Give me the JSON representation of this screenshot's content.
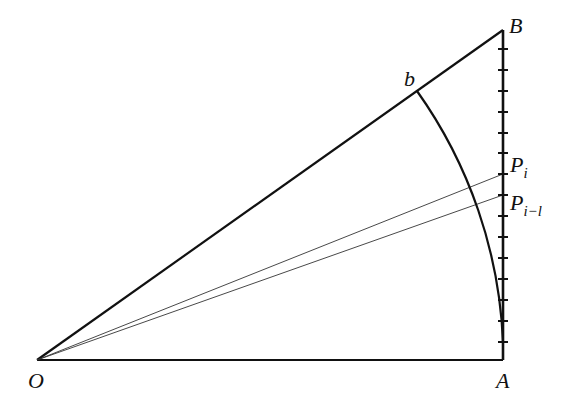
{
  "diagram": {
    "labels": {
      "O": "O",
      "A": "A",
      "B": "B",
      "b": "b",
      "Pi_main": "P",
      "Pi_sub": "i",
      "Pim1_main": "P",
      "Pim1_sub": "i−l"
    },
    "points": {
      "O": [
        37,
        360
      ],
      "A": [
        503,
        360
      ],
      "B": [
        503,
        30
      ],
      "b": [
        417,
        91
      ],
      "Pi": [
        503,
        174
      ],
      "Pim1": [
        503,
        195
      ]
    },
    "tick_y": [
      49,
      70,
      91,
      112,
      133,
      153,
      174,
      195,
      216,
      237,
      258,
      279,
      300,
      321,
      342
    ],
    "colors": {
      "stroke": "#111111",
      "thin": "#333333",
      "background": "#ffffff"
    }
  }
}
